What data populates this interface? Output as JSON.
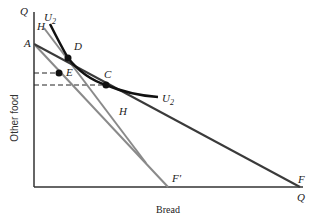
{
  "diagram": {
    "axes": {
      "y_axis_label": "Other food",
      "x_axis_label": "Bread",
      "y_axis_end_label": "Q",
      "x_axis_end_label": "Q"
    },
    "lines": {
      "budget_AF": {
        "start_label": "A",
        "end_label": "F",
        "color": "#3a3a3a"
      },
      "budget_AF_prime": {
        "end_label": "F′",
        "color": "#8a8a8a"
      },
      "budget_HH": {
        "start_label": "H",
        "end_label": "H",
        "color": "#8a8a8a"
      },
      "indifference_U2": {
        "start_label": "U",
        "start_sub": "2",
        "end_label": "U",
        "end_sub": "2",
        "color": "#111111"
      }
    },
    "points": {
      "D": "D",
      "E": "E",
      "C": "C"
    }
  }
}
